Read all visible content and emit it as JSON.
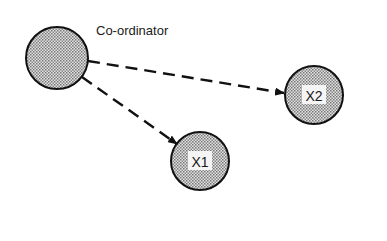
{
  "diagram": {
    "nodes": [
      {
        "id": "coordinator",
        "label": "",
        "caption": "Co-ordinator",
        "cx": 57,
        "cy": 58,
        "r": 31
      },
      {
        "id": "x2",
        "label": "X2",
        "cx": 314,
        "cy": 95,
        "r": 29
      },
      {
        "id": "x1",
        "label": "X1",
        "cx": 200,
        "cy": 161,
        "r": 29
      }
    ],
    "edges": [
      {
        "from": "coordinator",
        "to": "x2",
        "style": "dashed"
      },
      {
        "from": "coordinator",
        "to": "x1",
        "style": "dashed"
      }
    ],
    "colors": {
      "stroke": "#111111",
      "fill_dots": "#8a8a8a",
      "background": "#ffffff"
    }
  }
}
